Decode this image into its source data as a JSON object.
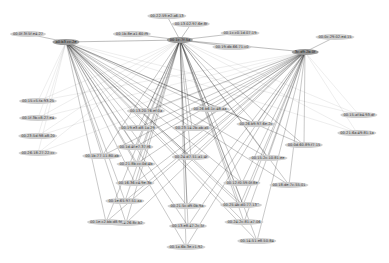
{
  "chart_data": {
    "type": "network",
    "title": "",
    "hubs": [
      {
        "id": "h1",
        "label": "a0:b3:cc:2e",
        "x": 66,
        "y": 42
      },
      {
        "id": "h2",
        "label": "00:1c:7f:5a",
        "x": 180,
        "y": 40
      },
      {
        "id": "h3",
        "label": "3c:d9:2b:0f",
        "x": 305,
        "y": 52
      }
    ],
    "nodes": [
      {
        "id": "n1",
        "label": "00:0f:3f:5f:e4:27",
        "x": 28,
        "y": 34
      },
      {
        "id": "n2",
        "label": "00:1b:8e:a1:60:f9",
        "x": 132,
        "y": 34
      },
      {
        "id": "n3",
        "label": "00:22:59:e2:a6:13",
        "x": 167,
        "y": 16
      },
      {
        "id": "n4",
        "label": "00:13:02:97:6e:8f",
        "x": 191,
        "y": 24
      },
      {
        "id": "n5",
        "label": "00:1c:c0:1d:07:19",
        "x": 240,
        "y": 33
      },
      {
        "id": "n6",
        "label": "00:19:db:66:71:c0",
        "x": 232,
        "y": 47
      },
      {
        "id": "n7",
        "label": "00:0c:29:02:ed:15",
        "x": 335,
        "y": 37
      },
      {
        "id": "n8",
        "label": "00:15:af:b4:93:df",
        "x": 359,
        "y": 115
      },
      {
        "id": "n9",
        "label": "00:21:6a:49:81:1a",
        "x": 357,
        "y": 133
      },
      {
        "id": "n10",
        "label": "00:15:c5:fa:93:25",
        "x": 38,
        "y": 101
      },
      {
        "id": "n11",
        "label": "00:1f:3b:c8:27:e4",
        "x": 38,
        "y": 118
      },
      {
        "id": "n12",
        "label": "00:23:5d:98:a8:20",
        "x": 38,
        "y": 136
      },
      {
        "id": "n13",
        "label": "00:26:18:27:22:cc",
        "x": 38,
        "y": 153
      },
      {
        "id": "n14",
        "label": "00:13:20:76:ef:0a",
        "x": 146,
        "y": 111
      },
      {
        "id": "n15",
        "label": "00:19:e3:d8:1a:29",
        "x": 138,
        "y": 128
      },
      {
        "id": "n16",
        "label": "00:1d:4f:e7:37:f6",
        "x": 135,
        "y": 147
      },
      {
        "id": "n17",
        "label": "00:1b:77:11:80:ab",
        "x": 102,
        "y": 156
      },
      {
        "id": "n18",
        "label": "00:21:8b:cc:0d:4b",
        "x": 136,
        "y": 164
      },
      {
        "id": "n19",
        "label": "00:16:36:c4:9e:3b",
        "x": 135,
        "y": 183
      },
      {
        "id": "n20",
        "label": "00:23:14:2b:ab:a5",
        "x": 192,
        "y": 128
      },
      {
        "id": "n21",
        "label": "00:24:d7:51:a1:4f",
        "x": 191,
        "y": 157
      },
      {
        "id": "n22",
        "label": "00:26:b6:1c:48:aa",
        "x": 210,
        "y": 109
      },
      {
        "id": "n23",
        "label": "00:26:b9:97:6e:2c",
        "x": 256,
        "y": 124
      },
      {
        "id": "n24",
        "label": "00:15:2c:10:81:ee",
        "x": 268,
        "y": 158
      },
      {
        "id": "n25",
        "label": "00:12:f0:59:0f:8e",
        "x": 242,
        "y": 183
      },
      {
        "id": "n26",
        "label": "00:18:de:7c:55:01",
        "x": 289,
        "y": 185
      },
      {
        "id": "n27",
        "label": "00:0d:60:89:f7:15",
        "x": 304,
        "y": 145
      },
      {
        "id": "n28",
        "label": "00:1e:65:97:51:aa",
        "x": 125,
        "y": 201
      },
      {
        "id": "n29",
        "label": "00:17:a4:26:8c:b2",
        "x": 126,
        "y": 223
      },
      {
        "id": "n30",
        "label": "00:21:5c:d9:0b:9a",
        "x": 187,
        "y": 206
      },
      {
        "id": "n31",
        "label": "00:13:e8:47:2c:5f",
        "x": 188,
        "y": 226
      },
      {
        "id": "n32",
        "label": "00:1f:3a:c4:9b:22",
        "x": 243,
        "y": 205
      },
      {
        "id": "n33",
        "label": "00:24:2c:81:a7:06",
        "x": 244,
        "y": 222
      },
      {
        "id": "n34",
        "label": "00:14:51:e8:50:84",
        "x": 257,
        "y": 241
      },
      {
        "id": "n35",
        "label": "00:1a:6b:3e:c1:92",
        "x": 186,
        "y": 247
      },
      {
        "id": "n36",
        "label": "00:25:4b:d0:77:13",
        "x": 240,
        "y": 205
      },
      {
        "id": "n37",
        "label": "00:1e:c2:bb:d8:9f",
        "x": 106,
        "y": 222
      }
    ],
    "grid": false,
    "legend": false
  }
}
